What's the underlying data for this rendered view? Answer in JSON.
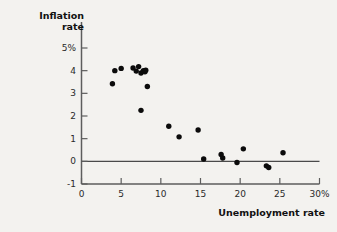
{
  "chart": {
    "title": "",
    "ylabel_line1": "Inflation",
    "ylabel_line2": "rate",
    "xlabel": "Unemployment rate",
    "background_color": "#f3f2ef",
    "point_color": "#0b0b0b",
    "axis_color": "#5d5d5d"
  },
  "chart_data": {
    "type": "scatter",
    "title": "",
    "xlabel": "Unemployment rate",
    "ylabel": "Inflation rate",
    "xlim": [
      0,
      30
    ],
    "ylim": [
      -1,
      5.6
    ],
    "xticks": [
      0,
      5,
      10,
      15,
      20,
      25,
      30
    ],
    "xtick_labels": [
      "0",
      "5",
      "10",
      "15",
      "20",
      "25",
      "30%"
    ],
    "yticks": [
      -1,
      0,
      1,
      2,
      3,
      4,
      5
    ],
    "ytick_labels": [
      "-1",
      "0",
      "1",
      "2",
      "3",
      "4",
      "5%"
    ],
    "grid": false,
    "legend": null,
    "zero_line": 0,
    "x": [
      3.9,
      4.2,
      5.0,
      6.5,
      6.9,
      7.2,
      7.5,
      7.8,
      8.0,
      8.1,
      8.3,
      7.5,
      11.0,
      12.3,
      14.7,
      15.4,
      17.6,
      17.8,
      19.6,
      20.4,
      23.3,
      23.6,
      25.4
    ],
    "y": [
      3.42,
      4.0,
      4.1,
      4.12,
      3.98,
      4.18,
      3.9,
      4.0,
      3.95,
      4.02,
      3.3,
      2.25,
      1.55,
      1.08,
      1.38,
      0.1,
      0.3,
      0.15,
      -0.05,
      0.55,
      -0.2,
      -0.27,
      0.38
    ],
    "marker": "circle",
    "marker_size": 5
  }
}
